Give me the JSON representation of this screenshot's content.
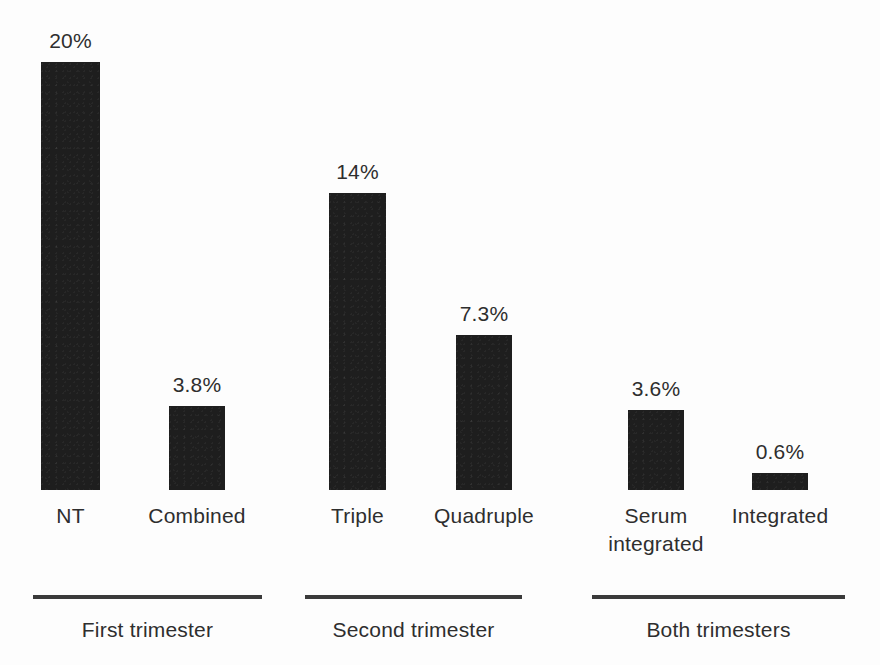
{
  "chart_data": {
    "type": "bar",
    "title": "",
    "subtitle": "",
    "xlabel": "",
    "ylabel": "",
    "grid": false,
    "legend": "none",
    "ylim": [
      0,
      20
    ],
    "categories": [
      "NT",
      "Combined",
      "Triple",
      "Quadruple",
      "Serum integrated",
      "Integrated"
    ],
    "values": [
      20,
      3.8,
      14,
      7.3,
      3.6,
      0.6
    ],
    "value_labels": [
      "20%",
      "3.8%",
      "14%",
      "7.3%",
      "3.6%",
      "0.6%"
    ],
    "groups": [
      {
        "label": "First trimester",
        "categories": [
          "NT",
          "Combined"
        ]
      },
      {
        "label": "Second trimester",
        "categories": [
          "Triple",
          "Quadruple"
        ]
      },
      {
        "label": "Both trimesters",
        "categories": [
          "Serum integrated",
          "Integrated"
        ]
      }
    ],
    "bar_color": "#1e1e1e",
    "background_color": "#fdfdfd"
  },
  "bars": [
    {
      "name": "nt",
      "value_label": "20%",
      "label_lines": [
        "NT"
      ],
      "left": 41,
      "width": 59,
      "height": 428
    },
    {
      "name": "combined",
      "value_label": "3.8%",
      "label_lines": [
        "Combined"
      ],
      "left": 169,
      "width": 56,
      "height": 84
    },
    {
      "name": "triple",
      "value_label": "14%",
      "label_lines": [
        "Triple"
      ],
      "left": 329,
      "width": 57,
      "height": 297
    },
    {
      "name": "quadruple",
      "value_label": "7.3%",
      "label_lines": [
        "Quadruple"
      ],
      "left": 456,
      "width": 56,
      "height": 155
    },
    {
      "name": "serum-integrated",
      "value_label": "3.6%",
      "label_lines": [
        "Serum",
        "integrated"
      ],
      "left": 628,
      "width": 56,
      "height": 80
    },
    {
      "name": "integrated",
      "value_label": "0.6%",
      "label_lines": [
        "Integrated"
      ],
      "left": 752,
      "width": 56,
      "height": 17
    }
  ],
  "groups": [
    {
      "name": "first-trimester",
      "caption": "First trimester",
      "rule_left": 33,
      "rule_width": 229,
      "caption_left": 33,
      "caption_width": 229
    },
    {
      "name": "second-trimester",
      "caption": "Second trimester",
      "rule_left": 305,
      "rule_width": 217,
      "caption_left": 295,
      "caption_width": 237
    },
    {
      "name": "both-trimesters",
      "caption": "Both trimesters",
      "rule_left": 592,
      "rule_width": 253,
      "caption_left": 582,
      "caption_width": 273
    }
  ]
}
